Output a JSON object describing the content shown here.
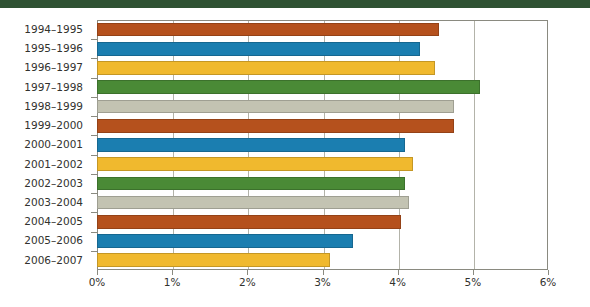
{
  "header": {
    "band_color": "#2f5233"
  },
  "chart_data": {
    "type": "bar",
    "orientation": "horizontal",
    "title": "",
    "subtitle": "",
    "xlabel": "",
    "ylabel": "",
    "xlim": [
      0,
      6
    ],
    "ylim": null,
    "grid": true,
    "legend": false,
    "legend_position": "none",
    "value_unit": "%",
    "xtick_labels": [
      "0%",
      "1%",
      "2%",
      "3%",
      "4%",
      "5%",
      "6%"
    ],
    "xtick_values": [
      0,
      1,
      2,
      3,
      4,
      5,
      6
    ],
    "categories": [
      "1994–1995",
      "1995–1996",
      "1996–1997",
      "1997–1998",
      "1998–1999",
      "1999–2000",
      "2000–2001",
      "2001–2002",
      "2002–2003",
      "2003–2004",
      "2004–2005",
      "2005–2006",
      "2006–2007"
    ],
    "values": [
      4.55,
      4.3,
      4.5,
      5.1,
      4.75,
      4.75,
      4.1,
      4.2,
      4.1,
      4.15,
      4.05,
      3.4,
      3.1
    ],
    "bar_colors": [
      "#b5511d",
      "#1b7eb0",
      "#f0b92e",
      "#4a8a36",
      "#c3c3b2",
      "#b5511d",
      "#1b7eb0",
      "#f0b92e",
      "#4a8a36",
      "#c3c3b2",
      "#b5511d",
      "#1b7eb0",
      "#f0b92e"
    ],
    "palette": {
      "rust": "#b5511d",
      "blue": "#1b7eb0",
      "amber": "#f0b92e",
      "green": "#4a8a36",
      "sage_gray": "#c3c3b2"
    },
    "axis_color": "#8a8a80",
    "gridline_color": "#b3b3a9",
    "text_color": "#32322e"
  }
}
